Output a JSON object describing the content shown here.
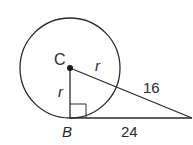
{
  "diagram": {
    "type": "geometry",
    "colors": {
      "stroke": "#2a2a2a",
      "background": "#ffffff"
    },
    "points": {
      "C": {
        "label": "C"
      },
      "B": {
        "label": "B"
      },
      "A": {
        "label": "A"
      }
    },
    "labels": {
      "center": "C",
      "tangent_point": "B",
      "radius_upper": "r",
      "radius_left": "r",
      "external_segment": "16",
      "tangent_length": "24"
    },
    "right_angle_at": "B"
  }
}
